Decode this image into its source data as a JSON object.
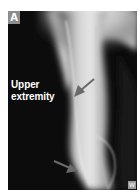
{
  "figure": {
    "panel_label": "A",
    "region_label_line1": "Upper",
    "region_label_line2": "extremity",
    "watermark": "W",
    "image_kind": "radiograph",
    "arrows": [
      {
        "name": "upper-arrow",
        "color": "#6a6a6a"
      },
      {
        "name": "lower-arrow",
        "color": "#6a6a6a"
      }
    ],
    "colors": {
      "background": "#0c0c0c",
      "label_box": "#8d8d8d",
      "text": "#ffffff"
    }
  }
}
